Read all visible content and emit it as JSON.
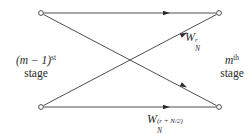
{
  "diagram": {
    "type": "butterfly",
    "left_label": {
      "line1_base": "(m − 1)",
      "line1_sup": "st",
      "line2": "stage"
    },
    "right_label": {
      "line1_base": "m",
      "line1_sup": "th",
      "line2": "stage"
    },
    "twiddle_top": {
      "base": "W",
      "sub": "N",
      "sup": "r"
    },
    "twiddle_bottom": {
      "base": "W",
      "sub": "N",
      "sup": "(r + N/2)"
    },
    "nodes": [
      {
        "id": "left-top",
        "x": 41,
        "y": 13
      },
      {
        "id": "left-bottom",
        "x": 41,
        "y": 107
      },
      {
        "id": "right-top",
        "x": 219,
        "y": 13
      },
      {
        "id": "right-bottom",
        "x": 219,
        "y": 107
      }
    ],
    "edges": [
      {
        "from": "left-top",
        "to": "right-top"
      },
      {
        "from": "left-top",
        "to": "right-bottom"
      },
      {
        "from": "left-bottom",
        "to": "right-top"
      },
      {
        "from": "left-bottom",
        "to": "right-bottom"
      }
    ],
    "colors": {
      "line": "#3a3a3a",
      "text": "#2a2a2a",
      "background": "#ffffff"
    }
  }
}
